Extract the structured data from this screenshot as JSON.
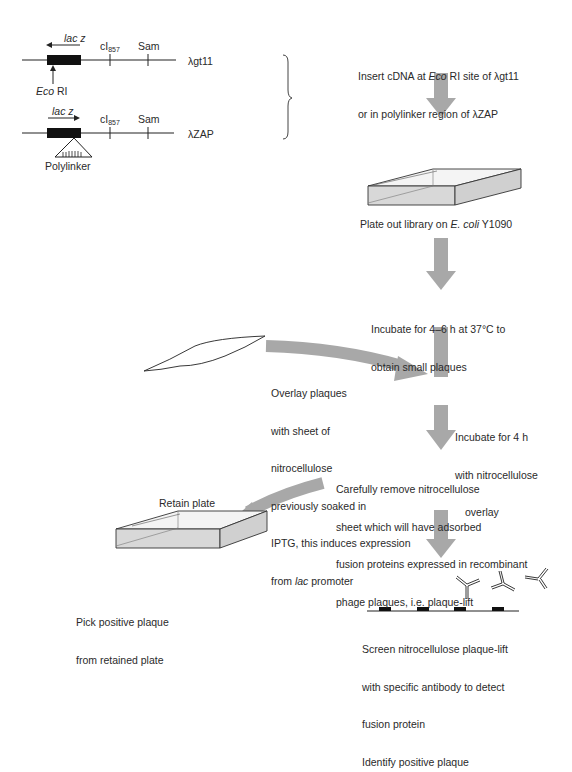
{
  "vectors": {
    "gt11": {
      "gene_label": "lac z",
      "gene_direction": "left",
      "marker1": "cI",
      "marker1_sub": "857",
      "marker2": "Sam",
      "name": "λgt11",
      "site_label_italic": "Eco",
      "site_label": " RI"
    },
    "zap": {
      "gene_label": "lac z",
      "gene_direction": "right",
      "marker1": "cI",
      "marker1_sub": "857",
      "marker2": "Sam",
      "name": "λZAP",
      "polylinker_label": "Polylinker"
    }
  },
  "steps": {
    "insert_line1_a": "Insert cDNA at ",
    "insert_line1_i": "Eco",
    "insert_line1_b": " RI site of λgt11",
    "insert_line2": "or in polylinker region of λZAP",
    "plate_a": "Plate out library on ",
    "plate_i": "E. coli",
    "plate_b": " Y1090",
    "incubate1_line1": "Incubate for 4–6 h at 37°C to",
    "incubate1_line2": "obtain small plaques",
    "overlay_lines": [
      "Overlay plaques",
      "with sheet of",
      "nitrocellulose",
      "previously soaked in",
      "IPTG, this induces expression"
    ],
    "overlay_last_a": "from ",
    "overlay_last_i": "lac",
    "overlay_last_b": " promoter",
    "incubate2_lines": [
      "Incubate for 4 h",
      "with nitrocellulose",
      "overlay"
    ],
    "remove_lines": [
      "Carefully remove nitrocellulose",
      "sheet which will have adsorbed",
      "fusion proteins expressed in recombinant",
      "phage plaques, i.e. plaque-lift"
    ],
    "retain_plate": "Retain plate",
    "pick_lines": [
      "Pick positive plaque",
      "from retained plate"
    ],
    "screen_lines": [
      "Screen nitrocellulose plaque-lift",
      "with specific antibody to detect",
      "fusion protein",
      "Identify positive plaque"
    ]
  },
  "colors": {
    "arrow": "#a8a8a8",
    "plate_fill": "#d4d4d4",
    "line": "#222222"
  }
}
